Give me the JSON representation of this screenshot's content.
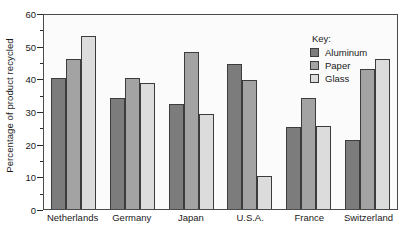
{
  "chart_data": {
    "type": "bar",
    "title": "",
    "xlabel": "",
    "ylabel": "Percentage of product recycled",
    "ylim": [
      0,
      60
    ],
    "ytick_step": 10,
    "yminor_step": 5,
    "grid": false,
    "legend_position": "top-right-inside",
    "legend_title": "Key:",
    "categories": [
      "Netherlands",
      "Germany",
      "Japan",
      "U.S.A.",
      "France",
      "Switzerland"
    ],
    "series": [
      {
        "name": "Aluminum",
        "color": "#7c7c7c",
        "values": [
          40,
          34,
          32,
          44.5,
          25,
          21
        ]
      },
      {
        "name": "Paper",
        "color": "#a3a3a3",
        "values": [
          46,
          40,
          48,
          39.5,
          34,
          43
        ]
      },
      {
        "name": "Glass",
        "color": "#dcdcdc",
        "values": [
          53,
          38.5,
          29,
          10,
          25.5,
          46
        ]
      }
    ],
    "ytick_labels": [
      "0",
      "10",
      "20",
      "30",
      "40",
      "50",
      "60"
    ],
    "ytick_values": [
      0,
      10,
      20,
      30,
      40,
      50,
      60
    ],
    "yminor_values": [
      5,
      15,
      25,
      35,
      45,
      55
    ]
  },
  "colors": {
    "axis": "#2b2b2b",
    "plot_border": "#4a4a4a",
    "plot_background": "#fbfbfb",
    "bar_outline": "#3c3c3c",
    "text": "#1a1a1a"
  }
}
